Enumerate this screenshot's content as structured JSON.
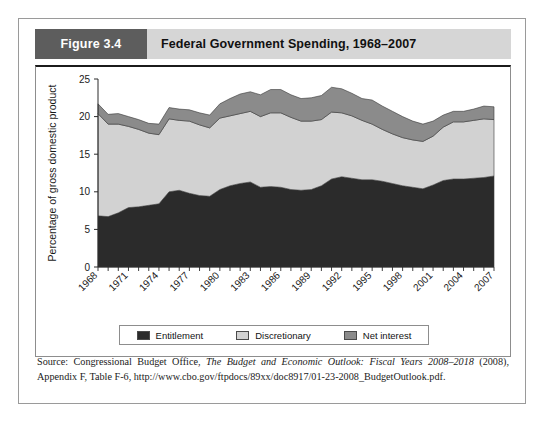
{
  "figure": {
    "number_label": "Figure 3.4",
    "title": "Federal Government Spending, 1968–2007"
  },
  "legend": {
    "items": [
      {
        "label": "Entitlement",
        "color": "#2b2b2b"
      },
      {
        "label": "Discretionary",
        "color": "#d2d2d2"
      },
      {
        "label": "Net interest",
        "color": "#8b8b8b"
      }
    ]
  },
  "source": {
    "prefix": "Source: Congressional Budget Office, ",
    "italic": "The Budget and Economic Outlook: Fiscal Years 2008–2018",
    "suffix": " (2008), Appendix F, Table F-6, http://www.cbo.gov/ftpdocs/89xx/doc8917/01-23-2008_BudgetOutlook.pdf."
  },
  "chart_data": {
    "type": "area",
    "stacked": true,
    "title": "Federal Government Spending, 1968–2007",
    "xlabel": "",
    "ylabel": "Percentage of gross domestic product",
    "ylim": [
      0,
      25
    ],
    "yticks": [
      0,
      5,
      10,
      15,
      20,
      25
    ],
    "xlim": [
      1968,
      2007
    ],
    "xticks": [
      1968,
      1971,
      1974,
      1977,
      1980,
      1983,
      1986,
      1989,
      1992,
      1995,
      1998,
      2001,
      2004,
      2007
    ],
    "xtick_rotation": 45,
    "grid": false,
    "legend_position": "bottom",
    "x": [
      1968,
      1969,
      1970,
      1971,
      1972,
      1973,
      1974,
      1975,
      1976,
      1977,
      1978,
      1979,
      1980,
      1981,
      1982,
      1983,
      1984,
      1985,
      1986,
      1987,
      1988,
      1989,
      1990,
      1991,
      1992,
      1993,
      1994,
      1995,
      1996,
      1997,
      1998,
      1999,
      2000,
      2001,
      2002,
      2003,
      2004,
      2005,
      2006,
      2007
    ],
    "series": [
      {
        "name": "Entitlement",
        "color": "#2b2b2b",
        "values": [
          6.8,
          6.7,
          7.2,
          7.9,
          8.0,
          8.2,
          8.4,
          10.0,
          10.2,
          9.8,
          9.5,
          9.4,
          10.3,
          10.8,
          11.1,
          11.3,
          10.6,
          10.7,
          10.6,
          10.3,
          10.2,
          10.3,
          10.8,
          11.7,
          12.0,
          11.8,
          11.6,
          11.6,
          11.4,
          11.1,
          10.8,
          10.6,
          10.4,
          10.9,
          11.5,
          11.7,
          11.7,
          11.8,
          11.9,
          12.1
        ]
      },
      {
        "name": "Discretionary",
        "color": "#d2d2d2",
        "values": [
          13.6,
          12.3,
          11.8,
          10.8,
          10.3,
          9.6,
          9.2,
          9.7,
          9.3,
          9.6,
          9.4,
          9.1,
          9.5,
          9.3,
          9.3,
          9.4,
          9.4,
          9.8,
          9.9,
          9.6,
          9.2,
          9.1,
          8.8,
          8.9,
          8.5,
          8.3,
          7.9,
          7.4,
          6.9,
          6.6,
          6.4,
          6.3,
          6.3,
          6.5,
          7.1,
          7.6,
          7.6,
          7.7,
          7.8,
          7.5
        ]
      },
      {
        "name": "Net interest",
        "color": "#8b8b8b",
        "values": [
          1.3,
          1.3,
          1.4,
          1.3,
          1.3,
          1.3,
          1.4,
          1.5,
          1.5,
          1.5,
          1.6,
          1.7,
          1.9,
          2.3,
          2.6,
          2.6,
          2.9,
          3.1,
          3.1,
          3.0,
          3.0,
          3.1,
          3.2,
          3.3,
          3.2,
          3.0,
          2.9,
          3.2,
          3.1,
          3.0,
          2.8,
          2.5,
          2.3,
          2.0,
          1.6,
          1.4,
          1.4,
          1.5,
          1.7,
          1.7
        ]
      }
    ]
  }
}
